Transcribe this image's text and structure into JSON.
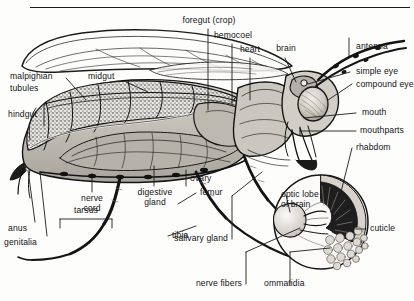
{
  "figure": {
    "style": "black-and-white engraved scientific illustration",
    "background_color": "#fdfdfc",
    "ink_color": "#141414"
  },
  "inset": {
    "name": "compound-eye-detail",
    "caption_line1": "optic lobe",
    "caption_line2": "of brain"
  },
  "labels": {
    "foregut_crop": "foregut (crop)",
    "hemocoel": "hemocoel",
    "heart": "heart",
    "brain": "brain",
    "antenna": "antenna",
    "simple_eye": "simple eye",
    "compound_eye": "compound eye",
    "mouth": "mouth",
    "mouthparts": "mouthparts",
    "rhabdom": "rhabdom",
    "cuticle": "cuticle",
    "ommatidia": "ommatidia",
    "nerve_fibers": "nerve fibers",
    "salivary_gland": "salivary gland",
    "tibia": "tibia",
    "femur": "femur",
    "ovary": "ovary",
    "tarsus": "tarsus",
    "digestive_gland_l1": "digestive",
    "digestive_gland_l2": "gland",
    "nerve_cord_l1": "nerve",
    "nerve_cord_l2": "cord",
    "genitalia": "genitalia",
    "anus": "anus",
    "hindgut": "hindgut",
    "malpighian_l1": "malpighian",
    "malpighian_l2": "tubules",
    "midgut": "midgut",
    "optic_lobe_l1": "optic lobe",
    "optic_lobe_l2": "of brain"
  }
}
